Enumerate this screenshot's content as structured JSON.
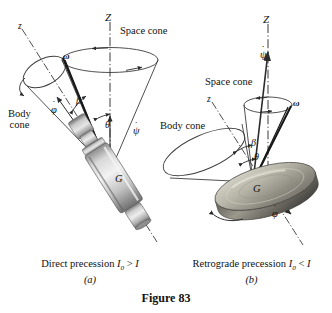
{
  "figure": {
    "number_label": "Figure 83",
    "background": "#ffffff",
    "ink": "#1a1a1a"
  },
  "panels": [
    {
      "id": "a",
      "panel_letter": "(a)",
      "caption_text": "Direct precession",
      "caption_symbol_base": "I",
      "caption_symbol_sub": "0",
      "caption_relation": ">",
      "caption_symbol_2": "I",
      "caption_full": "Direct precession I0 > I",
      "body_type": "spinning-top-shaft",
      "labels": {
        "Z_axis": "Z",
        "z_axis": "z",
        "omega": "ω",
        "space_cone": "Space cone",
        "body_cone_line1": "Body",
        "body_cone_line2": "cone",
        "phi_dot": "φ",
        "psi_dot": "ψ",
        "beta": "β",
        "theta": "θ",
        "mass_center": "G"
      }
    },
    {
      "id": "b",
      "panel_letter": "(b)",
      "caption_text": "Retrograde precession",
      "caption_symbol_base": "I",
      "caption_symbol_sub": "0",
      "caption_relation": "<",
      "caption_symbol_2": "I",
      "caption_full": "Retrograde precession I0 < I",
      "body_type": "spinning-disk",
      "labels": {
        "Z_axis": "Z",
        "z_axis": "z",
        "omega": "ω",
        "space_cone": "Space cone",
        "body_cone": "Body cone",
        "phi_dot": "φ",
        "psi_dot": "ψ",
        "beta": "β",
        "theta": "θ",
        "mass_center": "G"
      }
    }
  ],
  "colors": {
    "line": "#2b2b2b",
    "thin_line": "#4a4a4a",
    "metal_light": "#e7e7e7",
    "metal_mid": "#b9b9b9",
    "metal_dark": "#7c7c7c",
    "metal_darkest": "#5b5b5b"
  }
}
